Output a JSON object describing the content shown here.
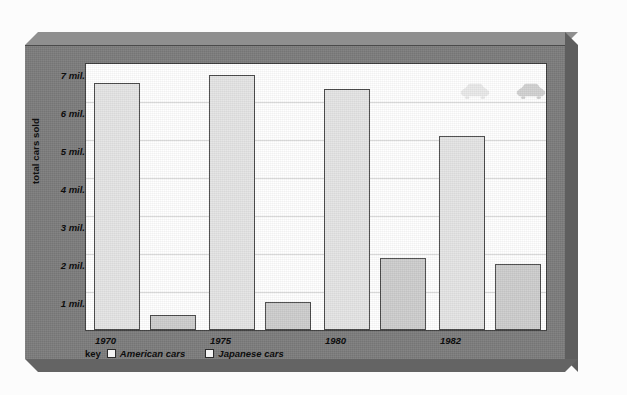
{
  "chart_data": {
    "type": "bar",
    "title": "",
    "xlabel": "",
    "ylabel": "total cars sold",
    "categories": [
      "1970",
      "1975",
      "1980",
      "1982"
    ],
    "series": [
      {
        "name": "American cars",
        "values": [
          6.5,
          6.7,
          6.35,
          5.1
        ],
        "color": "#e4e4e4"
      },
      {
        "name": "Japanese cars",
        "values": [
          0.4,
          0.75,
          1.9,
          1.75
        ],
        "color": "#cdcdcd"
      }
    ],
    "ylim": [
      0,
      7
    ],
    "yticks": [
      7,
      6,
      5,
      4,
      3,
      2,
      1
    ],
    "ytick_labels": [
      "7 mil.",
      "6 mil.",
      "5 mil.",
      "4 mil.",
      "3 mil.",
      "2 mil.",
      "1 mil."
    ],
    "grid": true,
    "legend_position": "bottom-left",
    "units": "millions of cars"
  },
  "legend": {
    "key_label": "key",
    "entries": [
      {
        "label": "American cars",
        "swatch_color": "#f2f2f2"
      },
      {
        "label": "Japanese cars",
        "swatch_color": "#f2f2f2"
      }
    ]
  },
  "decorations": {
    "car_icons": [
      {
        "name": "car-icon-american",
        "color": "#e9e9e9"
      },
      {
        "name": "car-icon-japanese",
        "color": "#d2d2d2"
      }
    ]
  },
  "colors": {
    "frame": "#7c7c7c",
    "frame_bevel_light": "#8f8f8f",
    "frame_bevel_dark": "#5e5e5e",
    "plot_background": "#ffffff",
    "gridline": "#d8d8d8",
    "bar_border": "#4a4a4a",
    "text": "#0d0d0d"
  }
}
